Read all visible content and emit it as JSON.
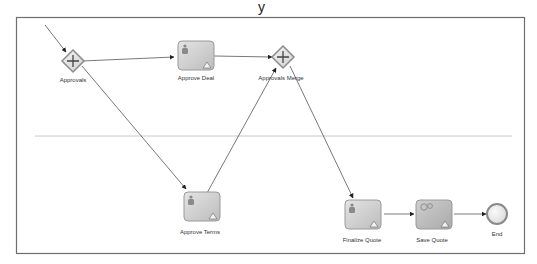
{
  "diagram": {
    "type": "bpmn-process",
    "top_glyph": "y",
    "colors": {
      "frame": "#6e6e6e",
      "lane_divider": "#c8c8c8",
      "edge": "#555555",
      "task_fill": "#d2d2d2",
      "task_border": "#9a9a9a",
      "gateway_fill": "#e6e6e6",
      "gateway_border": "#8c8c8c",
      "end_fill": "#ececec",
      "end_border": "#8a8a8a",
      "service_task_fill": "#bdbdbd"
    },
    "nodes": [
      {
        "id": "approvals",
        "kind": "parallel-gateway",
        "label": "Approvals"
      },
      {
        "id": "approve_deal",
        "kind": "user-task",
        "label": "Approve Deal"
      },
      {
        "id": "approvals_merge",
        "kind": "parallel-gateway",
        "label": "Approvals Merge"
      },
      {
        "id": "approve_terms",
        "kind": "user-task",
        "label": "Approve Terms"
      },
      {
        "id": "finalize_quote",
        "kind": "user-task",
        "label": "Finalize Quote"
      },
      {
        "id": "save_quote",
        "kind": "service-task",
        "label": "Save Quote"
      },
      {
        "id": "end",
        "kind": "end-event",
        "label": "End"
      }
    ],
    "edges": [
      {
        "from": "start",
        "to": "approvals"
      },
      {
        "from": "approvals",
        "to": "approve_deal"
      },
      {
        "from": "approvals",
        "to": "approve_terms"
      },
      {
        "from": "approve_deal",
        "to": "approvals_merge"
      },
      {
        "from": "approve_terms",
        "to": "approvals_merge"
      },
      {
        "from": "approvals_merge",
        "to": "finalize_quote"
      },
      {
        "from": "finalize_quote",
        "to": "save_quote"
      },
      {
        "from": "save_quote",
        "to": "end"
      }
    ]
  }
}
